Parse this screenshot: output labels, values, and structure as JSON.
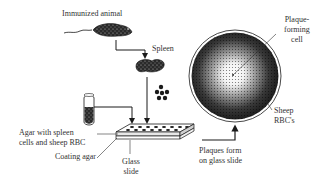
{
  "diagram": {
    "labels": {
      "immunized_animal": "Immunized animal",
      "spleen": "Spleen",
      "plaque_forming_line1": "Plaque-",
      "plaque_forming_line2": "forming",
      "plaque_forming_line3": "cell",
      "sheep_rbc_line1": "Sheep",
      "sheep_rbc_line2": "RBC's",
      "agar_line1": "Agar with spleen",
      "agar_line2": "cells and sheep RBC",
      "coating_agar": "Coating agar",
      "glass_line1": "Glass",
      "glass_line2": "slide",
      "plaques_line1": "Plaques form",
      "plaques_line2": "on glass slide"
    },
    "elements": [
      "mouse",
      "spleen",
      "spleen-cells",
      "test-tube",
      "agar-slide",
      "petri-dish-plaque"
    ],
    "colors": {
      "ink": "#1a1a1a",
      "text": "#333333",
      "background": "#ffffff"
    }
  }
}
